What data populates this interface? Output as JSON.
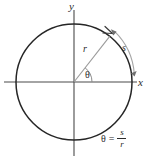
{
  "figure": {
    "kind": "radian-measure-unit-circle",
    "background_color": "#ffffff",
    "stroke_color": "#2b2b2b",
    "axis_color": "#4a4a4a",
    "radius_color": "#8a8a8a",
    "arc_marker_color": "#9a9a9a"
  },
  "labels": {
    "y_axis": "y",
    "x_axis": "x",
    "radius": "r",
    "arc_length": "s",
    "angle": "θ"
  },
  "formula": {
    "lhs": "θ",
    "equals": "=",
    "numerator": "s",
    "denominator": "r",
    "plain": "θ = s/r"
  },
  "geometry": {
    "center_x": 74,
    "center_y": 82,
    "circle_radius": 58,
    "angle_degrees": 52,
    "x_axis_from": 4,
    "x_axis_to": 137,
    "y_axis_from": 10,
    "y_axis_to": 156,
    "arc_marker_radius": 66
  }
}
